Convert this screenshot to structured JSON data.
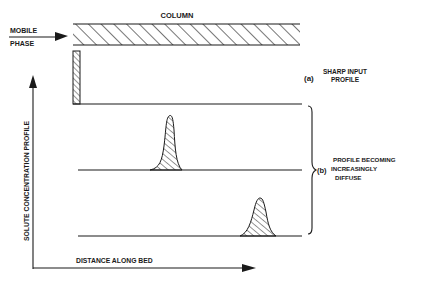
{
  "diagram": {
    "column_label": "COLUMN",
    "mobile_phase_label_line1": "MOBILE",
    "mobile_phase_label_line2": "PHASE",
    "y_axis_label": "SOLUTE CONCENTRATION PROFILE",
    "x_axis_label": "DISTANCE ALONG BED",
    "annotation_a": {
      "marker": "(a)",
      "line1": "SHARP INPUT",
      "line2": "PROFILE"
    },
    "annotation_b": {
      "marker": "(b)",
      "line1": "PROFILE BECOMING",
      "line2": "INCREASINGLY",
      "line3": "DIFFUSE"
    },
    "profiles": [
      {
        "name": "sharp-input",
        "shape": "rectangular pulse",
        "position": "column inlet"
      },
      {
        "name": "broadening-peak-1",
        "shape": "narrow peak",
        "position": "mid bed"
      },
      {
        "name": "broadening-peak-2",
        "shape": "wider peak",
        "position": "further along bed"
      }
    ],
    "colors": {
      "ink": "#1a1a1a",
      "background": "#ffffff"
    }
  }
}
